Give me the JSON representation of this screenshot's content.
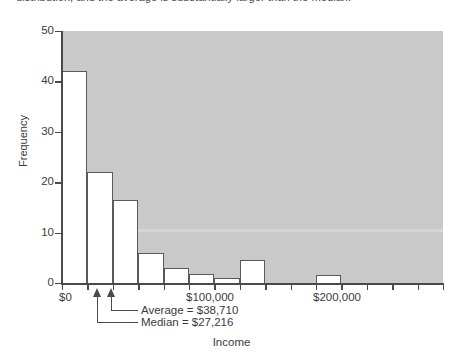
{
  "caption": {
    "text": "distribution, and the average is substantially larger than the median."
  },
  "chart_data": {
    "type": "bar",
    "title": "",
    "subtitle": "",
    "xlabel": "Income",
    "ylabel": "Frequency",
    "xlim": [
      0,
      300000
    ],
    "ylim": [
      0,
      50
    ],
    "grid": false,
    "legend": null,
    "bin_width": 20000,
    "bin_edges": [
      0,
      20000,
      40000,
      60000,
      80000,
      100000,
      120000,
      140000,
      160000,
      180000,
      200000,
      220000,
      240000,
      260000,
      280000,
      300000
    ],
    "categories": [
      "$0-$20,000",
      "$20,000-$40,000",
      "$40,000-$60,000",
      "$60,000-$80,000",
      "$80,000-$100,000",
      "$100,000-$120,000",
      "$120,000-$140,000",
      "$140,000-$160,000",
      "$160,000-$180,000",
      "$180,000-$200,000",
      "$200,000-$220,000",
      "$220,000-$240,000",
      "$240,000-$260,000",
      "$260,000-$280,000",
      "$280,000-$300,000"
    ],
    "values": [
      42,
      22,
      16.5,
      6,
      3,
      1.7,
      1,
      4.5,
      0,
      0,
      1.5,
      0,
      0,
      0,
      0
    ],
    "y_ticks": [
      0,
      10,
      20,
      30,
      40,
      50
    ],
    "y_tick_labels": [
      "0",
      "10",
      "20",
      "30",
      "40",
      "50"
    ],
    "x_ticks": [
      0,
      100000,
      200000
    ],
    "x_tick_labels": [
      "$0",
      "$100,000",
      "$200,000"
    ],
    "plot_background_color": "#c9c9c9",
    "bar_fill_color": "#ffffff",
    "bar_edge_color": "#5a5a5a",
    "annotations": [
      {
        "label": "Average  =  $38,710",
        "value": 38710
      },
      {
        "label": "Median  =  $27,216",
        "value": 27216
      }
    ]
  }
}
